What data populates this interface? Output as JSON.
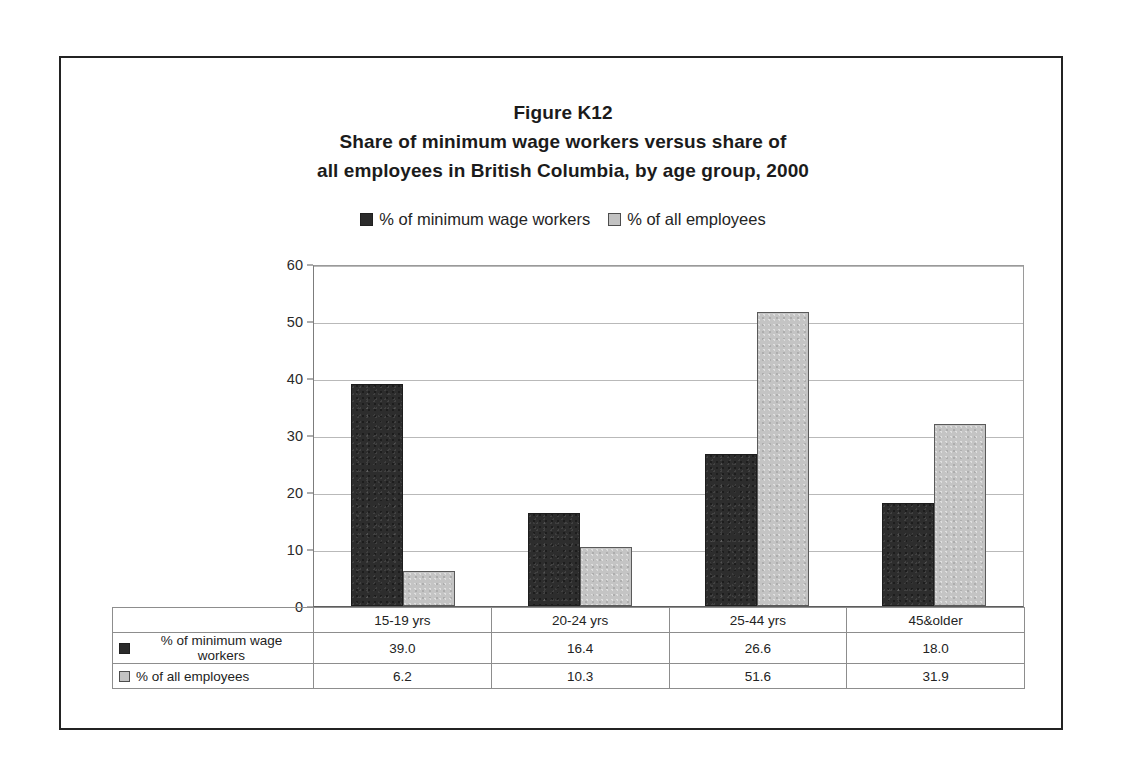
{
  "figure": {
    "title_lines": [
      "Figure K12",
      "Share of minimum wage workers versus share of",
      "all employees in British Columbia, by age group, 2000"
    ]
  },
  "colors": {
    "series_dark": "#2d2d2d",
    "series_light": "#c4c4c4",
    "frame": "#232323",
    "gridline": "#b9b9b9"
  },
  "legend": {
    "position": "top-center",
    "entries": [
      {
        "label": "% of minimum wage workers",
        "swatch": "dark-square-icon"
      },
      {
        "label": "% of all employees",
        "swatch": "light-square-icon"
      }
    ]
  },
  "chart_data": {
    "type": "bar",
    "title": "Share of minimum wage workers versus share of all employees in British Columbia, by age group, 2000",
    "xlabel": "",
    "ylabel": "",
    "ylim": [
      0,
      60
    ],
    "yticks": [
      0,
      10,
      20,
      30,
      40,
      50,
      60
    ],
    "ytick_labels": [
      "0",
      "10",
      "20",
      "30",
      "40",
      "50",
      "60"
    ],
    "grid": true,
    "categories": [
      "15-19 yrs",
      "20-24 yrs",
      "25-44 yrs",
      "45&older"
    ],
    "series": [
      {
        "name": "% of minimum wage workers",
        "color": "#2d2d2d",
        "values": [
          39.0,
          16.4,
          26.6,
          18.0
        ],
        "labels": [
          "39.0",
          "16.4",
          "26.6",
          "18.0"
        ]
      },
      {
        "name": "% of all employees",
        "color": "#c4c4c4",
        "values": [
          6.2,
          10.3,
          51.6,
          31.9
        ],
        "labels": [
          "6.2",
          "10.3",
          "51.6",
          "31.9"
        ]
      }
    ]
  },
  "data_table": {
    "corner_label": "",
    "column_headers": [
      "15-19 yrs",
      "20-24 yrs",
      "25-44 yrs",
      "45&older"
    ],
    "rows": [
      {
        "label": "% of minimum wage workers",
        "swatch": "dark-square-icon",
        "values": [
          "39.0",
          "16.4",
          "26.6",
          "18.0"
        ]
      },
      {
        "label": "% of all employees",
        "swatch": "light-square-icon",
        "values": [
          "6.2",
          "10.3",
          "51.6",
          "31.9"
        ]
      }
    ]
  }
}
